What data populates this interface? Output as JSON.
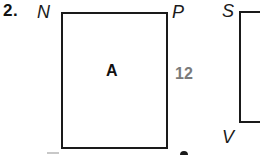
{
  "problem": {
    "number_label": "2."
  },
  "figure_a": {
    "vertices": {
      "top_left": "N",
      "top_right": "P",
      "bottom_left": "",
      "bottom_right": ""
    },
    "center_label": "A",
    "side_length_label": "12",
    "side_length_color": "#7a7a7a"
  },
  "figure_b": {
    "vertices": {
      "top_left": "S",
      "bottom_left": "V"
    }
  },
  "colors": {
    "stroke": "#1a1a1a",
    "background": "#ffffff",
    "muted_label": "#7a7a7a"
  }
}
